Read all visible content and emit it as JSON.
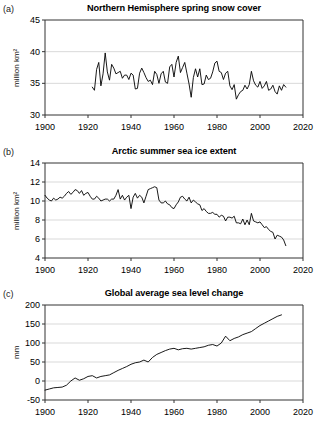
{
  "figure": {
    "side_note": "Evidence for Climate Change"
  },
  "panels": [
    {
      "letter": "(a)",
      "title": "Northern Hemisphere spring snow cover",
      "ylabel": "million km²"
    },
    {
      "letter": "(b)",
      "title": "Arctic summer sea ice extent",
      "ylabel": "million km²"
    },
    {
      "letter": "(c)",
      "title": "Global average sea level change",
      "ylabel": "mm"
    }
  ],
  "chart_data": [
    {
      "type": "line",
      "title": "Northern Hemisphere spring snow cover",
      "xlabel": "",
      "ylabel": "million km²",
      "xlim": [
        1900,
        2020
      ],
      "ylim": [
        30,
        45
      ],
      "xticks": [
        1900,
        1920,
        1940,
        1960,
        1980,
        2000,
        2020
      ],
      "yticks": [
        30,
        35,
        40,
        45
      ],
      "grid": true,
      "legend": "none",
      "x": [
        1922,
        1923,
        1924,
        1925,
        1926,
        1927,
        1928,
        1929,
        1930,
        1931,
        1932,
        1933,
        1934,
        1935,
        1936,
        1937,
        1938,
        1939,
        1940,
        1941,
        1942,
        1943,
        1944,
        1945,
        1946,
        1947,
        1948,
        1949,
        1950,
        1951,
        1952,
        1953,
        1954,
        1955,
        1956,
        1957,
        1958,
        1959,
        1960,
        1961,
        1962,
        1963,
        1964,
        1965,
        1966,
        1967,
        1968,
        1969,
        1970,
        1971,
        1972,
        1973,
        1974,
        1975,
        1976,
        1977,
        1978,
        1979,
        1980,
        1981,
        1982,
        1983,
        1984,
        1985,
        1986,
        1987,
        1988,
        1989,
        1990,
        1991,
        1992,
        1993,
        1994,
        1995,
        1996,
        1997,
        1998,
        1999,
        2000,
        2001,
        2002,
        2003,
        2004,
        2005,
        2006,
        2007,
        2008,
        2009,
        2010,
        2011,
        2012
      ],
      "values": [
        34.4,
        33.9,
        37.2,
        38.3,
        34.6,
        36.5,
        39.8,
        36.8,
        35.5,
        38.0,
        37.4,
        36.5,
        36.7,
        36.9,
        35.8,
        36.3,
        36.3,
        35.6,
        36.6,
        36.3,
        34.1,
        34.2,
        36.6,
        37.4,
        36.7,
        35.9,
        35.3,
        35.5,
        34.8,
        36.9,
        36.4,
        35.0,
        36.5,
        36.9,
        35.2,
        35.0,
        37.6,
        38.0,
        36.0,
        38.3,
        39.3,
        36.7,
        37.5,
        38.3,
        36.6,
        34.9,
        32.8,
        35.9,
        37.3,
        36.0,
        37.3,
        34.8,
        34.9,
        36.3,
        35.6,
        35.8,
        36.8,
        38.2,
        38.5,
        36.9,
        36.7,
        35.6,
        36.6,
        36.9,
        34.6,
        34.0,
        34.8,
        32.5,
        33.2,
        33.7,
        33.9,
        34.7,
        34.1,
        34.8,
        36.9,
        35.4,
        34.7,
        34.4,
        35.3,
        34.2,
        34.6,
        35.3,
        33.9,
        34.1,
        34.7,
        33.7,
        33.3,
        34.6,
        33.9,
        34.8,
        34.4
      ]
    },
    {
      "type": "line",
      "title": "Arctic summer sea ice extent",
      "xlabel": "",
      "ylabel": "million km²",
      "xlim": [
        1900,
        2020
      ],
      "ylim": [
        4,
        14
      ],
      "xticks": [
        1900,
        1920,
        1940,
        1960,
        1980,
        2000,
        2020
      ],
      "yticks": [
        4,
        6,
        8,
        10,
        12,
        14
      ],
      "grid": true,
      "legend": "none",
      "x": [
        1900,
        1901,
        1902,
        1903,
        1904,
        1905,
        1906,
        1907,
        1908,
        1909,
        1910,
        1911,
        1912,
        1913,
        1914,
        1915,
        1916,
        1917,
        1918,
        1919,
        1920,
        1921,
        1922,
        1923,
        1924,
        1925,
        1926,
        1927,
        1928,
        1929,
        1930,
        1931,
        1932,
        1933,
        1934,
        1935,
        1936,
        1937,
        1938,
        1939,
        1940,
        1941,
        1942,
        1943,
        1944,
        1945,
        1946,
        1947,
        1948,
        1949,
        1950,
        1951,
        1952,
        1953,
        1954,
        1955,
        1956,
        1957,
        1958,
        1959,
        1960,
        1961,
        1962,
        1963,
        1964,
        1965,
        1966,
        1967,
        1968,
        1969,
        1970,
        1971,
        1972,
        1973,
        1974,
        1975,
        1976,
        1977,
        1978,
        1979,
        1980,
        1981,
        1982,
        1983,
        1984,
        1985,
        1986,
        1987,
        1988,
        1989,
        1990,
        1991,
        1992,
        1993,
        1994,
        1995,
        1996,
        1997,
        1998,
        1999,
        2000,
        2001,
        2002,
        2003,
        2004,
        2005,
        2006,
        2007,
        2008,
        2009,
        2010,
        2011,
        2012
      ],
      "values": [
        10.6,
        10.3,
        10.1,
        10.0,
        10.3,
        10.1,
        10.2,
        10.4,
        10.3,
        10.5,
        10.8,
        11.0,
        10.7,
        10.9,
        11.2,
        11.1,
        10.8,
        11.1,
        10.6,
        10.8,
        10.9,
        10.5,
        10.2,
        10.2,
        10.5,
        10.3,
        10.0,
        10.1,
        10.2,
        10.2,
        10.0,
        10.2,
        10.2,
        10.6,
        11.2,
        10.2,
        10.6,
        10.1,
        10.4,
        10.6,
        9.2,
        10.4,
        10.8,
        10.3,
        10.6,
        10.4,
        9.8,
        10.5,
        11.2,
        11.3,
        11.4,
        11.5,
        11.4,
        10.1,
        9.8,
        9.8,
        10.0,
        9.7,
        9.6,
        9.3,
        9.2,
        9.6,
        9.9,
        10.4,
        10.5,
        10.2,
        10.0,
        10.4,
        9.8,
        10.1,
        9.9,
        9.7,
        9.6,
        9.0,
        9.2,
        8.9,
        8.7,
        8.7,
        8.8,
        8.6,
        8.6,
        8.3,
        8.5,
        8.4,
        7.9,
        8.3,
        8.3,
        8.2,
        8.4,
        7.7,
        7.7,
        7.6,
        8.1,
        7.5,
        8.0,
        7.5,
        8.7,
        7.9,
        7.8,
        7.7,
        7.8,
        7.5,
        7.2,
        7.3,
        7.0,
        6.8,
        6.7,
        6.0,
        6.4,
        6.3,
        6.2,
        5.9,
        5.3
      ]
    },
    {
      "type": "line",
      "title": "Global average sea level change",
      "xlabel": "",
      "ylabel": "mm",
      "xlim": [
        1900,
        2020
      ],
      "ylim": [
        -50,
        200
      ],
      "xticks": [
        1900,
        1920,
        1940,
        1960,
        1980,
        2000,
        2020
      ],
      "yticks": [
        -50,
        0,
        50,
        100,
        150,
        200
      ],
      "grid": true,
      "legend": "none",
      "x": [
        1900,
        1902,
        1904,
        1906,
        1908,
        1910,
        1912,
        1914,
        1916,
        1918,
        1920,
        1922,
        1924,
        1926,
        1928,
        1930,
        1932,
        1934,
        1936,
        1938,
        1940,
        1942,
        1944,
        1946,
        1948,
        1950,
        1952,
        1954,
        1956,
        1958,
        1960,
        1962,
        1964,
        1966,
        1968,
        1970,
        1972,
        1974,
        1976,
        1978,
        1980,
        1982,
        1984,
        1986,
        1988,
        1990,
        1992,
        1994,
        1996,
        1998,
        2000,
        2002,
        2004,
        2006,
        2008,
        2010
      ],
      "values": [
        -24,
        -21,
        -18,
        -17,
        -16,
        -11,
        0,
        8,
        2,
        6,
        12,
        14,
        8,
        12,
        14,
        16,
        22,
        28,
        33,
        38,
        44,
        48,
        50,
        55,
        50,
        62,
        70,
        75,
        80,
        84,
        86,
        82,
        85,
        86,
        84,
        86,
        88,
        90,
        94,
        96,
        92,
        100,
        118,
        106,
        112,
        116,
        122,
        126,
        130,
        138,
        146,
        152,
        158,
        164,
        170,
        174
      ]
    }
  ]
}
